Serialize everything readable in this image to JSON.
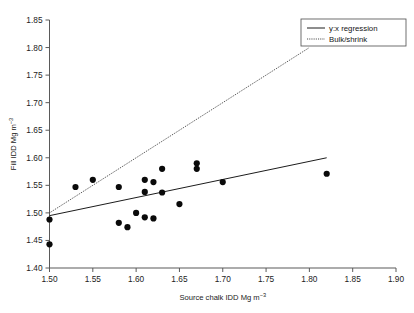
{
  "chart_data": {
    "type": "scatter",
    "title": "",
    "xlabel": "Source chalk IDD Mg m−3",
    "ylabel": "Fill IDD Mg m−3",
    "xlabel_main": "Source chalk IDD Mg m",
    "xlabel_sup": "−3",
    "ylabel_main": "Fill IDD Mg m",
    "ylabel_sup": "−3",
    "xlim": [
      1.5,
      1.9
    ],
    "ylim": [
      1.4,
      1.85
    ],
    "xticks": [
      1.5,
      1.55,
      1.6,
      1.65,
      1.7,
      1.75,
      1.8,
      1.85,
      1.9
    ],
    "yticks": [
      1.4,
      1.45,
      1.5,
      1.55,
      1.6,
      1.65,
      1.7,
      1.75,
      1.8,
      1.85
    ],
    "xtick_labels": [
      "1.50",
      "1.55",
      "1.60",
      "1.65",
      "1.70",
      "1.75",
      "1.80",
      "1.85",
      "1.90"
    ],
    "ytick_labels": [
      "1.40",
      "1.45",
      "1.50",
      "1.55",
      "1.60",
      "1.65",
      "1.70",
      "1.75",
      "1.80",
      "1.85"
    ],
    "grid": false,
    "legend_position": "top-right",
    "marker": "filled-circle",
    "marker_color": "#0a0a0a",
    "points": [
      {
        "x": 1.5,
        "y": 1.443
      },
      {
        "x": 1.5,
        "y": 1.488
      },
      {
        "x": 1.53,
        "y": 1.547
      },
      {
        "x": 1.55,
        "y": 1.56
      },
      {
        "x": 1.58,
        "y": 1.547
      },
      {
        "x": 1.58,
        "y": 1.482
      },
      {
        "x": 1.59,
        "y": 1.474
      },
      {
        "x": 1.6,
        "y": 1.5
      },
      {
        "x": 1.61,
        "y": 1.56
      },
      {
        "x": 1.61,
        "y": 1.538
      },
      {
        "x": 1.61,
        "y": 1.492
      },
      {
        "x": 1.62,
        "y": 1.556
      },
      {
        "x": 1.62,
        "y": 1.49
      },
      {
        "x": 1.63,
        "y": 1.58
      },
      {
        "x": 1.63,
        "y": 1.537
      },
      {
        "x": 1.65,
        "y": 1.516
      },
      {
        "x": 1.67,
        "y": 1.59
      },
      {
        "x": 1.67,
        "y": 1.58
      },
      {
        "x": 1.7,
        "y": 1.556
      },
      {
        "x": 1.82,
        "y": 1.571
      }
    ],
    "lines": [
      {
        "name": "y:x regression",
        "style": "solid",
        "color": "#1c1c1c",
        "x": [
          1.5,
          1.82
        ],
        "y": [
          1.495,
          1.6
        ]
      },
      {
        "name": "Bulk/shrink",
        "style": "dotted",
        "color": "#2a2a2a",
        "x": [
          1.5,
          1.8
        ],
        "y": [
          1.5,
          1.8
        ]
      }
    ],
    "legend": [
      {
        "label": "y:x regression",
        "style": "solid"
      },
      {
        "label": "Bulk/shrink",
        "style": "dotted"
      }
    ]
  }
}
